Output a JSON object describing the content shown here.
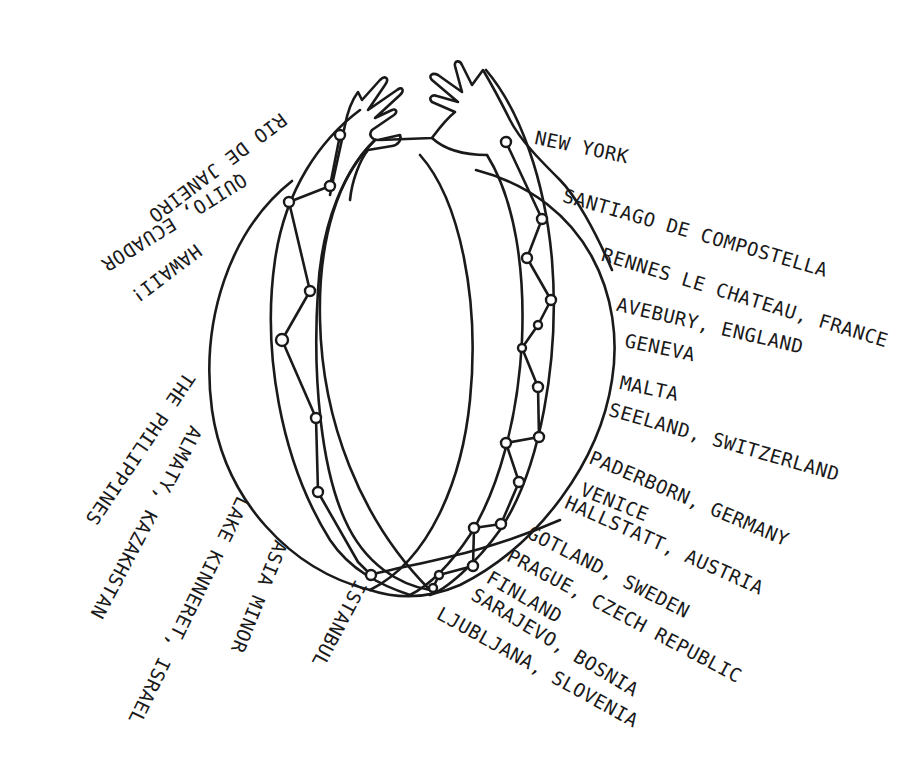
{
  "diagram": {
    "ink_color": "#1a1a1a",
    "background": "#ffffff",
    "figure": "two hands reaching from a globe with node-chain meridians",
    "labels_right": [
      {
        "text": "New York",
        "x": 537,
        "y": 128,
        "rot": 12
      },
      {
        "text": "Santiago de Compostella",
        "x": 566,
        "y": 186,
        "rot": 16
      },
      {
        "text": "Rennes le Chateau, France",
        "x": 605,
        "y": 245,
        "rot": 17
      },
      {
        "text": "Avebury, England",
        "x": 619,
        "y": 295,
        "rot": 13
      },
      {
        "text": "Geneva",
        "x": 627,
        "y": 331,
        "rot": 12
      },
      {
        "text": "Malta",
        "x": 622,
        "y": 373,
        "rot": 12
      },
      {
        "text": "Seeland, Switzerland",
        "x": 612,
        "y": 400,
        "rot": 16
      },
      {
        "text": "Paderborn, Germany",
        "x": 594,
        "y": 448,
        "rot": 23
      },
      {
        "text": "Venice",
        "x": 585,
        "y": 480,
        "rot": 22
      },
      {
        "text": "Hallstatt, Austria",
        "x": 570,
        "y": 493,
        "rot": 24
      },
      {
        "text": "Gotland, Sweden",
        "x": 533,
        "y": 523,
        "rot": 27
      },
      {
        "text": "Prague, Czech Republic",
        "x": 513,
        "y": 546,
        "rot": 28
      },
      {
        "text": "Finland",
        "x": 493,
        "y": 568,
        "rot": 30
      },
      {
        "text": "Sarajevo, Bosnia",
        "x": 478,
        "y": 585,
        "rot": 31
      },
      {
        "text": "Ljubljana, Slovenia",
        "x": 443,
        "y": 604,
        "rot": 29
      }
    ],
    "labels_left": [
      {
        "text": "Rio de Janeiro",
        "x": 290,
        "y": 125,
        "rot": 143
      },
      {
        "text": "Quito, Ecuador",
        "x": 250,
        "y": 186,
        "rot": 148
      },
      {
        "text": "Hawaii!",
        "x": 205,
        "y": 256,
        "rot": 143
      },
      {
        "text": "The Philippines",
        "x": 198,
        "y": 380,
        "rot": 124
      },
      {
        "text": "Almaty, Kazakhstan",
        "x": 205,
        "y": 432,
        "rot": 118
      },
      {
        "text": "Lake Kinneret, Israel",
        "x": 252,
        "y": 502,
        "rot": 116
      },
      {
        "text": "Asia Minor",
        "x": 290,
        "y": 545,
        "rot": 112
      },
      {
        "text": "Istanbul",
        "x": 370,
        "y": 586,
        "rot": 118
      }
    ],
    "nodes_left": [
      [
        340,
        135
      ],
      [
        330,
        186
      ],
      [
        289,
        202
      ],
      [
        310,
        291
      ],
      [
        282,
        340
      ],
      [
        316,
        418
      ],
      [
        318,
        492
      ],
      [
        358,
        562
      ],
      [
        371,
        575
      ]
    ],
    "nodes_right": [
      [
        506,
        142
      ],
      [
        542,
        219
      ],
      [
        527,
        258
      ],
      [
        551,
        300
      ],
      [
        538,
        325
      ],
      [
        522,
        348
      ],
      [
        538,
        387
      ],
      [
        539,
        437
      ],
      [
        506,
        443
      ],
      [
        519,
        482
      ],
      [
        474,
        528
      ],
      [
        501,
        524
      ],
      [
        505,
        565
      ],
      [
        439,
        575
      ],
      [
        433,
        588
      ],
      [
        473,
        566
      ]
    ]
  }
}
